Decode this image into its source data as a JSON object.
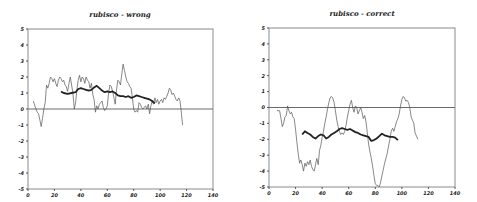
{
  "chart_data": [
    {
      "type": "line",
      "title": "rubisco - wrong",
      "xlabel": "",
      "ylabel": "",
      "xlim": [
        0,
        140
      ],
      "ylim": [
        -5,
        5
      ],
      "xticks": [
        0,
        20,
        40,
        60,
        80,
        100,
        120,
        140
      ],
      "yticks": [
        -5,
        -4,
        -3,
        -2,
        -1,
        0,
        1,
        2,
        3,
        4,
        5
      ],
      "grid": false,
      "reference_line_y": 0,
      "series": [
        {
          "name": "raw",
          "style": "thin",
          "x": [
            4,
            6,
            7,
            8,
            9,
            10,
            11,
            12,
            13,
            14,
            15,
            16,
            17,
            18,
            19,
            20,
            21,
            22,
            23,
            24,
            25,
            26,
            27,
            28,
            29,
            30,
            31,
            32,
            33,
            34,
            35,
            36,
            37,
            38,
            39,
            40,
            41,
            42,
            43,
            44,
            45,
            46,
            47,
            48,
            49,
            50,
            51,
            52,
            53,
            54,
            55,
            56,
            57,
            58,
            59,
            60,
            61,
            62,
            63,
            64,
            65,
            66,
            67,
            68,
            69,
            70,
            71,
            72,
            73,
            74,
            75,
            76,
            77,
            78,
            79,
            80,
            81,
            82,
            83,
            84,
            85,
            86,
            87,
            88,
            89,
            90,
            91,
            92,
            93,
            94,
            95,
            96,
            97,
            98,
            99,
            100,
            101,
            102,
            103,
            104,
            105,
            106,
            107,
            108,
            109,
            110,
            111,
            112,
            113,
            114,
            115,
            116,
            117
          ],
          "values": [
            0.5,
            0.0,
            -0.2,
            -0.3,
            -0.7,
            -1.1,
            -0.6,
            0.0,
            0.4,
            1.5,
            1.3,
            1.6,
            2.0,
            1.9,
            1.7,
            1.9,
            1.6,
            1.4,
            1.8,
            2.0,
            1.9,
            1.7,
            1.8,
            1.5,
            1.4,
            1.1,
            1.6,
            2.0,
            1.5,
            1.0,
            0.0,
            0.4,
            1.2,
            1.8,
            2.1,
            1.7,
            2.0,
            1.9,
            1.6,
            2.0,
            1.8,
            1.7,
            1.3,
            1.6,
            0.9,
            0.6,
            -0.2,
            0.2,
            0.0,
            0.3,
            0.4,
            0.5,
            0.1,
            -0.1,
            0.0,
            0.2,
            1.0,
            1.5,
            1.4,
            1.1,
            0.7,
            0.3,
            1.2,
            1.8,
            1.7,
            1.5,
            2.2,
            2.8,
            2.4,
            2.0,
            1.7,
            1.6,
            1.4,
            1.3,
            0.7,
            0.0,
            -0.2,
            -0.1,
            -0.2,
            0.4,
            0.3,
            0.1,
            0.0,
            0.1,
            0.2,
            0.0,
            0.3,
            -0.3,
            0.2,
            0.5,
            0.3,
            0.7,
            0.4,
            0.6,
            0.3,
            0.5,
            0.6,
            0.4,
            0.7,
            0.6,
            0.8,
            1.0,
            1.3,
            1.2,
            0.9,
            1.0,
            0.8,
            0.6,
            0.5,
            0.7,
            0.5,
            -0.2,
            -1.0
          ]
        },
        {
          "name": "smoothed",
          "style": "thick",
          "x": [
            25,
            27,
            30,
            33,
            36,
            38,
            40,
            42,
            44,
            46,
            48,
            50,
            52,
            54,
            56,
            58,
            60,
            62,
            64,
            66,
            68,
            70,
            72,
            74,
            76,
            78,
            80,
            82,
            84,
            86,
            88,
            90,
            92,
            94,
            96
          ],
          "values": [
            1.1,
            1.0,
            0.95,
            1.0,
            1.05,
            1.25,
            1.3,
            1.25,
            1.2,
            1.15,
            1.2,
            1.35,
            1.45,
            1.3,
            1.15,
            1.05,
            1.1,
            1.05,
            1.1,
            1.0,
            0.85,
            0.8,
            0.8,
            0.75,
            0.8,
            0.7,
            0.75,
            0.85,
            0.8,
            0.75,
            0.7,
            0.65,
            0.6,
            0.5,
            0.35
          ]
        }
      ]
    },
    {
      "type": "line",
      "title": "rubisco - correct",
      "xlabel": "",
      "ylabel": "",
      "xlim": [
        0,
        140
      ],
      "ylim": [
        -5,
        5
      ],
      "xticks": [
        0,
        20,
        40,
        60,
        80,
        100,
        120,
        140
      ],
      "yticks": [
        -5,
        -4,
        -3,
        -2,
        -1,
        0,
        1,
        2,
        3,
        4,
        5
      ],
      "grid": false,
      "reference_line_y": 0,
      "series": [
        {
          "name": "raw",
          "style": "thin",
          "x": [
            6,
            8,
            9,
            10,
            11,
            12,
            13,
            14,
            15,
            16,
            17,
            18,
            19,
            20,
            21,
            22,
            23,
            24,
            25,
            26,
            27,
            28,
            29,
            30,
            31,
            32,
            33,
            34,
            35,
            36,
            37,
            38,
            39,
            40,
            41,
            42,
            43,
            44,
            45,
            46,
            47,
            48,
            49,
            50,
            51,
            52,
            53,
            54,
            55,
            56,
            57,
            58,
            59,
            60,
            61,
            62,
            63,
            64,
            65,
            66,
            67,
            68,
            69,
            70,
            71,
            72,
            73,
            74,
            75,
            76,
            77,
            78,
            79,
            80,
            81,
            82,
            83,
            84,
            85,
            86,
            87,
            88,
            89,
            90,
            91,
            92,
            93,
            94,
            95,
            96,
            97,
            98,
            99,
            100,
            101,
            102,
            103,
            104,
            105,
            106,
            107,
            108,
            109,
            110,
            111,
            112,
            113,
            114,
            115,
            116,
            117
          ],
          "values": [
            -0.2,
            -0.2,
            -0.7,
            -1.2,
            -1.0,
            -0.6,
            -0.5,
            0.1,
            -0.2,
            -0.4,
            -0.3,
            -0.6,
            -0.7,
            -1.4,
            -2.2,
            -2.9,
            -3.5,
            -3.3,
            -3.6,
            -4.0,
            -3.5,
            -3.7,
            -3.4,
            -3.6,
            -3.3,
            -3.7,
            -3.9,
            -4.0,
            -3.6,
            -3.2,
            -3.6,
            -2.7,
            -2.4,
            -1.9,
            -1.5,
            -1.0,
            -0.6,
            -0.1,
            0.3,
            0.6,
            0.7,
            0.6,
            0.3,
            -0.2,
            -0.8,
            -1.2,
            -1.5,
            -1.7,
            -1.6,
            -1.7,
            -1.5,
            -1.1,
            -0.6,
            -0.2,
            0.2,
            0.45,
            0.0,
            -0.3,
            0.1,
            0.0,
            -0.4,
            -0.2,
            0.0,
            -0.3,
            -0.7,
            -0.5,
            -0.9,
            -1.6,
            -2.3,
            -2.8,
            -3.2,
            -3.7,
            -4.3,
            -4.8,
            -4.9,
            -4.9,
            -5.0,
            -4.7,
            -4.3,
            -3.9,
            -3.5,
            -3.2,
            -2.9,
            -2.4,
            -2.0,
            -1.5,
            -1.3,
            -1.5,
            -1.2,
            -0.9,
            -0.7,
            -0.4,
            0.1,
            0.5,
            0.7,
            0.6,
            0.4,
            0.45,
            0.3,
            0.0,
            -0.6,
            -0.8,
            -1.0,
            -1.6,
            -1.8,
            -2.0
          ],
          "xstart": 6
        },
        {
          "name": "smoothed",
          "style": "thick",
          "x": [
            25,
            27,
            29,
            31,
            33,
            35,
            37,
            39,
            41,
            43,
            45,
            47,
            49,
            51,
            53,
            55,
            57,
            59,
            61,
            63,
            65,
            67,
            69,
            71,
            73,
            75,
            77,
            79,
            81,
            83,
            85,
            87,
            89,
            91,
            93,
            95,
            97
          ],
          "values": [
            -1.7,
            -1.5,
            -1.6,
            -1.7,
            -1.85,
            -1.95,
            -1.8,
            -1.7,
            -1.75,
            -1.95,
            -1.85,
            -1.7,
            -1.6,
            -1.5,
            -1.35,
            -1.3,
            -1.35,
            -1.4,
            -1.35,
            -1.45,
            -1.55,
            -1.6,
            -1.7,
            -1.75,
            -1.8,
            -1.85,
            -2.1,
            -2.05,
            -1.95,
            -1.8,
            -1.65,
            -1.75,
            -1.8,
            -1.85,
            -1.85,
            -1.9,
            -2.05
          ]
        }
      ]
    }
  ],
  "panels": [
    {
      "title": "rubisco - wrong"
    },
    {
      "title": "rubisco - correct"
    }
  ]
}
